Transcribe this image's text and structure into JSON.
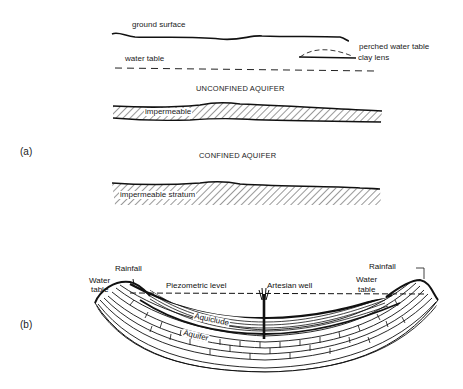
{
  "figure": {
    "panel_a": {
      "label": "(a)",
      "unconfined": {
        "ground_surface": "ground surface",
        "water_table": "water table",
        "perched_water_table": "perched water table",
        "clay_lens": "clay lens",
        "title": "UNCONFINED AQUIFER",
        "impermeable": "impermeable"
      },
      "confined": {
        "title": "CONFINED AQUIFER",
        "impermeable_stratum": "impermeable stratum"
      }
    },
    "panel_b": {
      "label": "(b)",
      "water_table_left": [
        "Water",
        "table"
      ],
      "rainfall_left": "Rainfall",
      "piezometric_level": "Piezometric level",
      "artesian_well": "Artesian well",
      "rainfall_right": "Rainfall",
      "water_table_right": [
        "Water",
        "table"
      ],
      "aquiclude": "Aquiclude",
      "aquifer": "Aquifer"
    }
  }
}
